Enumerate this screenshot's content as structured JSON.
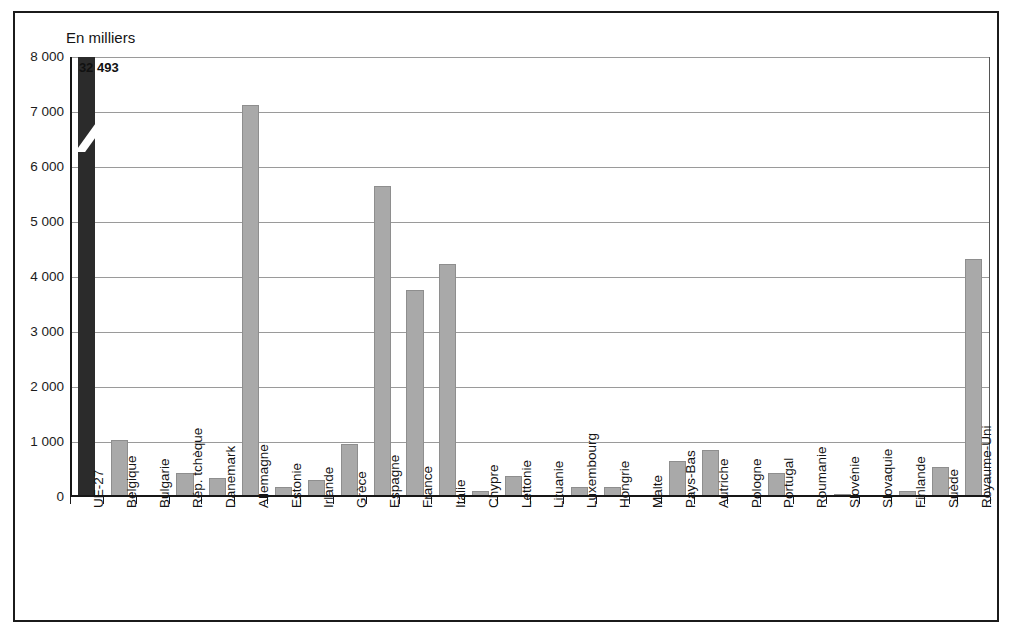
{
  "chart_data": {
    "type": "bar",
    "title": "",
    "subtitle": "",
    "axis_note": "En milliers",
    "xlabel": "",
    "ylabel": "En milliers",
    "ylim": [
      0,
      8000
    ],
    "ytick_labels": [
      "0",
      "1 000",
      "2 000",
      "3 000",
      "4 000",
      "5 000",
      "6 000",
      "7 000",
      "8 000"
    ],
    "ytick_values": [
      0,
      1000,
      2000,
      3000,
      4000,
      5000,
      6000,
      7000,
      8000
    ],
    "grid": true,
    "legend": "none",
    "axis_break": {
      "present": true,
      "series_index": 0,
      "note": "UE-27 bar is truncated with a diagonal break; true value shown as data label"
    },
    "categories": [
      "UE-27",
      "Belgique",
      "Bulgarie",
      "Rép. tchèque",
      "Danemark",
      "Allemagne",
      "Estonie",
      "Irlande",
      "Grèce",
      "Espagne",
      "France",
      "Italie",
      "Chypre",
      "Lettonie",
      "Lituanie",
      "Luxembourg",
      "Hongrie",
      "Malte",
      "Pays-Bas",
      "Autriche",
      "Pologne",
      "Portugal",
      "Roumanie",
      "Slovénie",
      "Slovaquie",
      "Finlande",
      "Suède",
      "Royaume-Uni"
    ],
    "values": [
      32493,
      1040,
      0,
      430,
      340,
      7130,
      190,
      310,
      960,
      5650,
      3770,
      4230,
      110,
      390,
      25,
      190,
      180,
      15,
      650,
      850,
      40,
      440,
      10,
      60,
      35,
      110,
      550,
      4330
    ],
    "data_labels": [
      {
        "category": "UE-27",
        "text": "32 493"
      }
    ],
    "colors": {
      "bar": "#a9a9a9",
      "bar_highlight": "#2b2b2b",
      "grid": "#9a9a9a",
      "axis": "#161616",
      "text": "#141414",
      "background": "#ffffff",
      "frame": "#1b1b1b"
    }
  }
}
